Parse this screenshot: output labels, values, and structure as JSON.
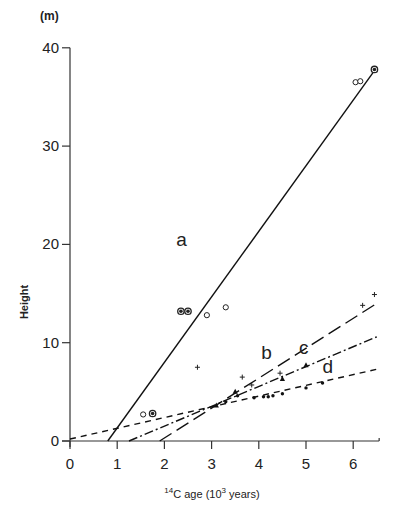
{
  "chart_data": {
    "type": "scatter",
    "title": "",
    "xlabel": "14C age (10^3 years)",
    "xlabel_parts": {
      "pre": "14",
      "main": "C age  (10",
      "sup": "3",
      "post": " years)"
    },
    "ylabel": "Height",
    "y_unit": "(m)",
    "xlim": [
      0,
      6.5
    ],
    "ylim": [
      0,
      40
    ],
    "x_ticks": [
      0,
      1,
      2,
      3,
      4,
      5,
      6
    ],
    "y_ticks": [
      0,
      10,
      20,
      30,
      40
    ],
    "grid": false,
    "legend": "none (lines labelled inline a, b, c, d)",
    "lines": [
      {
        "name": "a",
        "style": "solid",
        "x": [
          0.8,
          6.5
        ],
        "y": [
          0,
          38
        ],
        "label_pos": [
          2.25,
          19.8
        ]
      },
      {
        "name": "b",
        "style": "long-dash",
        "x": [
          1.9,
          6.5
        ],
        "y": [
          0,
          14
        ],
        "label_pos": [
          4.05,
          8.3
        ]
      },
      {
        "name": "c",
        "style": "dash-dot",
        "x": [
          1.25,
          6.5
        ],
        "y": [
          0,
          10.6
        ],
        "label_pos": [
          4.85,
          8.8
        ]
      },
      {
        "name": "d",
        "style": "short-dash",
        "x": [
          0,
          6.5
        ],
        "y": [
          0.2,
          7.3
        ],
        "label_pos": [
          5.35,
          6.9
        ]
      }
    ],
    "series": [
      {
        "name": "open circles",
        "marker": "open-circle",
        "x": [
          1.55,
          2.9,
          3.3,
          6.05,
          6.15
        ],
        "y": [
          2.7,
          12.8,
          13.6,
          36.5,
          36.6
        ]
      },
      {
        "name": "dotted circles",
        "marker": "circle-dot",
        "x": [
          1.75,
          2.35,
          2.5,
          6.45
        ],
        "y": [
          2.8,
          13.2,
          13.2,
          37.8
        ]
      },
      {
        "name": "crosses",
        "marker": "plus",
        "x": [
          2.7,
          3.65,
          3.85,
          4.45,
          6.2,
          6.45
        ],
        "y": [
          7.5,
          6.5,
          5.7,
          6.9,
          13.8,
          14.9
        ]
      },
      {
        "name": "triangles",
        "marker": "triangle",
        "x": [
          3.1,
          3.5,
          4.5,
          5.0
        ],
        "y": [
          3.6,
          5.0,
          6.3,
          7.7
        ]
      },
      {
        "name": "dots",
        "marker": "dot",
        "x": [
          3.3,
          3.55,
          3.9,
          4.1,
          4.2,
          4.3,
          4.5,
          5.0,
          5.35
        ],
        "y": [
          4.0,
          4.6,
          4.4,
          4.5,
          4.5,
          4.6,
          4.8,
          5.4,
          5.9
        ]
      }
    ]
  }
}
